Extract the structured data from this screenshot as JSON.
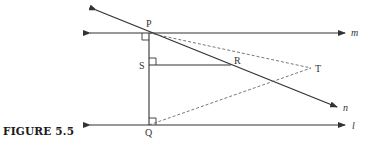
{
  "caption": "FIGURE 5.5",
  "points": {
    "P": "P",
    "S": "S",
    "R": "R",
    "T": "T",
    "Q": "Q"
  },
  "lines": {
    "m": "m",
    "n": "n",
    "l": "l"
  },
  "colors": {
    "stroke": "#333333",
    "background": "#ffffff"
  }
}
